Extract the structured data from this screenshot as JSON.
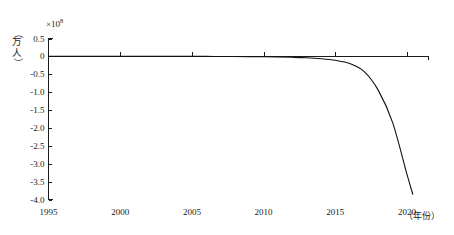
{
  "chart_data": {
    "type": "line",
    "title": "",
    "subtitle": "",
    "xlabel": "（年份）",
    "ylabel": "（万人）",
    "y_multiplier": "×10",
    "y_multiplier_exponent": "8",
    "xlim": [
      1995,
      2021.5
    ],
    "ylim": [
      -4.0,
      0.5
    ],
    "grid": false,
    "legend": false,
    "x_ticks": [
      1995,
      2000,
      2005,
      2010,
      2015,
      2020
    ],
    "x_tick_labels": [
      "1995",
      "2000",
      "2005",
      "2010",
      "2015",
      "2020"
    ],
    "y_ticks": [
      0.5,
      0,
      -0.5,
      -1.0,
      -1.5,
      -2.0,
      -2.5,
      -3.0,
      -3.5,
      -4.0
    ],
    "y_tick_labels": [
      "0.5",
      "0",
      "-0.5",
      "-1.0",
      "-1.5",
      "-2.0",
      "-2.5",
      "-3.0",
      "-3.5",
      "-4.0"
    ],
    "series": [
      {
        "name": "人口变化",
        "color": "#111111",
        "x": [
          1995,
          1996,
          1997,
          1998,
          1999,
          2000,
          2001,
          2002,
          2003,
          2004,
          2005,
          2006,
          2007,
          2008,
          2009,
          2010,
          2011,
          2012,
          2013,
          2014,
          2015,
          2016,
          2017,
          2018,
          2019,
          2020,
          2020.4
        ],
        "values": [
          0.005,
          0.005,
          0.005,
          0.004,
          0.004,
          0.004,
          0.003,
          0.003,
          0.002,
          0.002,
          0.001,
          0.0,
          -0.002,
          -0.004,
          -0.007,
          -0.011,
          -0.017,
          -0.026,
          -0.04,
          -0.065,
          -0.11,
          -0.2,
          -0.42,
          -0.95,
          -1.85,
          -3.3,
          -3.85
        ]
      }
    ]
  },
  "colors": {
    "axis": "#1a1a1a",
    "curve": "#111111",
    "background": "#ffffff"
  }
}
